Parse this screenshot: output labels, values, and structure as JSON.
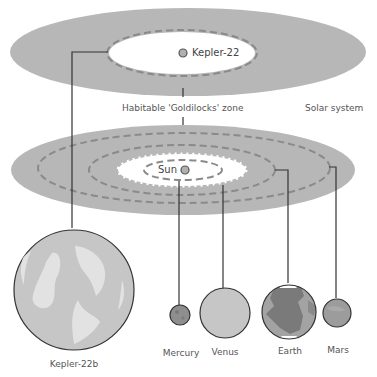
{
  "diagram": {
    "title_labels": {
      "habitable_zone": "Habitable 'Goldilocks' zone",
      "solar_system": "Solar system"
    },
    "kepler_system": {
      "star_label": "Kepler-22",
      "planet_label": "Kepler-22b"
    },
    "solar_system": {
      "star_label": "Sun",
      "planets": [
        {
          "name": "Mercury"
        },
        {
          "name": "Venus"
        },
        {
          "name": "Earth"
        },
        {
          "name": "Mars"
        }
      ]
    },
    "colors": {
      "zone_gray": "#b7b7b7",
      "dash_gray": "#8a8a8a",
      "planet_light": "#c6c6c6",
      "planet_highlight": "#e2e2e2",
      "earth_land": "#7a7a7a",
      "earth_sea": "#a3a3a3",
      "mars": "#9c9c9c",
      "mercury": "#8e8e8e",
      "line": "#333333"
    }
  }
}
